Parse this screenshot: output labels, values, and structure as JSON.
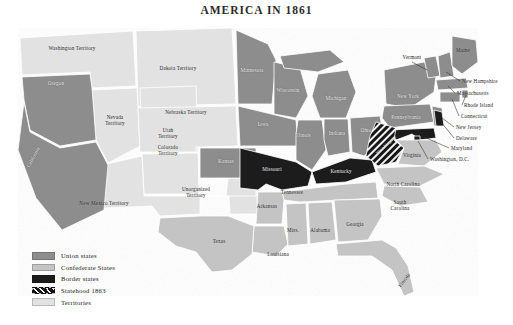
{
  "map": {
    "title": "AMERICA IN 1861",
    "background": "#ffffff"
  },
  "colors": {
    "union": "#8d8d8d",
    "confederate": "#c4c4c4",
    "border_states": "#1c1c1c",
    "statehood_1863": "#151515",
    "territories": "#e2e2e2",
    "water": "#ffffff",
    "outline": "#ffffff",
    "text": "#1d1d1d"
  },
  "legend": {
    "items": [
      {
        "label": "Union states",
        "swatch": "union",
        "color": "#8d8d8d"
      },
      {
        "label": "Confederate States",
        "swatch": "confederate",
        "color": "#c4c4c4"
      },
      {
        "label": "Border states",
        "swatch": "border",
        "color": "#1c1c1c"
      },
      {
        "label": "Statehood 1863",
        "swatch": "hatched",
        "color": "#151515"
      },
      {
        "label": "Territories",
        "swatch": "territories",
        "color": "#e2e2e2"
      }
    ]
  },
  "labels": {
    "washington_territory": "Washington Territory",
    "oregon": "Oregon",
    "dakota_territory": "Dakota Territory",
    "minnesota": "Minnesota",
    "wisconsin": "Wisconsin",
    "michigan": "Michigan",
    "vermont": "Vermont",
    "maine": "Maine",
    "new_hampshire": "New Hampshire",
    "massachusetts": "Massachusetts",
    "rhode_island": "Rhode Island",
    "connecticut": "Connecticut",
    "new_york": "New York",
    "pennsylvania": "Pennsylvania",
    "new_jersey": "New Jersey",
    "delaware": "Delaware",
    "maryland": "Maryland",
    "washington_dc": "Washington, D.C.",
    "nevada_territory_1": "Nevada",
    "nevada_territory_2": "Territory",
    "utah_territory_1": "Utah",
    "utah_territory_2": "Territory",
    "nebraska_territory": "Nebraska Territory",
    "colorado_territory_1": "Colorado",
    "colorado_territory_2": "Territory",
    "california": "California",
    "iowa": "Iowa",
    "illinois": "Illinois",
    "indiana": "Indiana",
    "ohio": "Ohio",
    "kansas": "Kansas",
    "missouri": "Missouri",
    "kentucky": "Kentucky",
    "west_virginia": "West Virginia",
    "virginia": "Virginia",
    "unorganized_territory_1": "Unorganized",
    "unorganized_territory_2": "Territory",
    "new_mexico_territory": "New Mexico Territory",
    "tennessee": "Tennessee",
    "north_carolina": "North Carolina",
    "south_carolina_1": "South",
    "south_carolina_2": "Carolina",
    "arkansas": "Arkansas",
    "texas": "Texas",
    "louisiana": "Louisiana",
    "mississippi": "Miss.",
    "alabama": "Alabama",
    "georgia": "Georgia",
    "florida": "Florida"
  }
}
